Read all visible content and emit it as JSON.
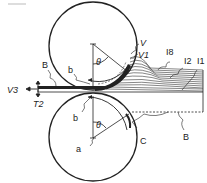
{
  "diagram": {
    "type": "roll-compaction cross-section",
    "labels": {
      "V": "V",
      "V1": "V1",
      "I8": "I8",
      "I2": "I2",
      "I1": "I1",
      "B_top": "B",
      "b_top": "b",
      "V3": "V3",
      "T2": "T2",
      "b_bottom": "b",
      "theta_top": "θ",
      "theta_bottom": "θ",
      "a": "a",
      "C": "C",
      "B_bottom": "B"
    },
    "colors": {
      "line": "#222222",
      "background": "#ffffff"
    }
  }
}
